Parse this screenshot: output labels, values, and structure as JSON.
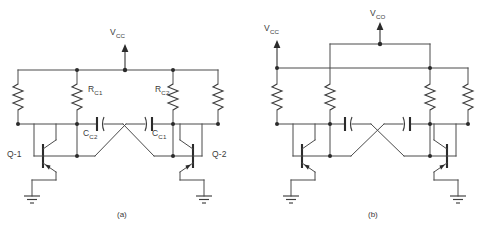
{
  "figure": {
    "background_color": "#ffffff",
    "wire_color": "#4a4a4a",
    "text_color": "#3a3a3a"
  },
  "panels": [
    {
      "id": "a",
      "caption": "(a)",
      "supply_label": "V",
      "supply_sub": "CC",
      "components": [
        {
          "name": "resistor-rc1",
          "label": "R",
          "sub": "C1",
          "type": "resistor"
        },
        {
          "name": "resistor-rc2",
          "label": "R",
          "sub": "C2",
          "type": "resistor"
        },
        {
          "name": "capacitor-cc2",
          "label": "C",
          "sub": "C2",
          "type": "capacitor"
        },
        {
          "name": "capacitor-cc1",
          "label": "C",
          "sub": "C1",
          "type": "capacitor"
        },
        {
          "name": "transistor-q1",
          "label": "Q-1",
          "type": "npn-transistor"
        },
        {
          "name": "transistor-q2",
          "label": "Q-2",
          "type": "npn-transistor"
        }
      ]
    },
    {
      "id": "b",
      "caption": "(b)",
      "supply_label": "V",
      "supply_sub": "CC",
      "output_label": "V",
      "output_sub": "CO",
      "components": [
        {
          "name": "resistor-b1",
          "type": "resistor"
        },
        {
          "name": "resistor-b2",
          "type": "resistor"
        },
        {
          "name": "resistor-b3",
          "type": "resistor"
        },
        {
          "name": "resistor-b4",
          "type": "resistor"
        },
        {
          "name": "capacitor-b1",
          "type": "capacitor"
        },
        {
          "name": "capacitor-b2",
          "type": "capacitor"
        },
        {
          "name": "transistor-b1",
          "type": "npn-transistor"
        },
        {
          "name": "transistor-b2",
          "type": "npn-transistor"
        }
      ]
    }
  ],
  "symbols": {
    "ground": "ground-symbol",
    "supply_arrow": "up-arrow",
    "junction": "junction-dot"
  }
}
